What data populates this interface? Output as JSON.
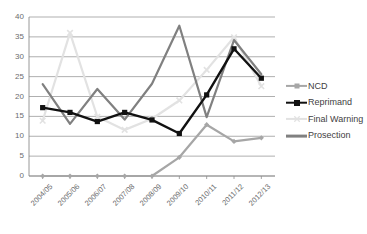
{
  "chart_data": {
    "type": "line",
    "title": "",
    "xlabel": "",
    "ylabel": "",
    "ylim": [
      0,
      40
    ],
    "ytick_step": 5,
    "grid": true,
    "legend_position": "right",
    "categories": [
      "2004/05",
      "2005/06",
      "2006/07",
      "2007/08",
      "2008/09",
      "2009/10",
      "2010/11",
      "2011/12",
      "2012/13"
    ],
    "yticks": [
      "0",
      "5",
      "10",
      "15",
      "20",
      "25",
      "30",
      "35",
      "40"
    ],
    "series": [
      {
        "name": "NCD",
        "color": "#a6a6a6",
        "marker": "diamond",
        "values": [
          0,
          0,
          0,
          0,
          0,
          4.7,
          12.9,
          8.7,
          9.6
        ]
      },
      {
        "name": "Reprimand",
        "color": "#111111",
        "marker": "square",
        "values": [
          17.2,
          16.0,
          13.7,
          16.0,
          14.1,
          10.7,
          20.4,
          32.0,
          24.6
        ]
      },
      {
        "name": "Final Warning",
        "color": "#e2e2e2",
        "marker": "x",
        "values": [
          13.9,
          36.0,
          14.9,
          11.6,
          14.4,
          19.0,
          26.7,
          34.9,
          22.6
        ]
      },
      {
        "name": "Prosection",
        "color": "#808080",
        "marker": "none",
        "values": [
          23.1,
          13.1,
          21.9,
          14.2,
          23.2,
          37.8,
          14.8,
          34.2,
          25.6
        ]
      }
    ]
  },
  "legend": {
    "items": [
      {
        "label": "NCD"
      },
      {
        "label": "Reprimand"
      },
      {
        "label": "Final Warning"
      },
      {
        "label": "Prosection"
      }
    ]
  }
}
